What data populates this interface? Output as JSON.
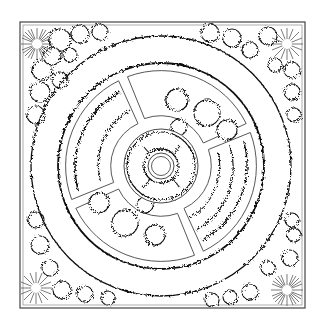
{
  "diagram": {
    "kind": "landscape-garden-plan",
    "style": "black line art on white",
    "colors": {
      "background": "#ffffff",
      "line": "#111111",
      "frame": "#444444"
    },
    "frame": {
      "x": 20,
      "y": 22,
      "width": 285,
      "height": 286
    },
    "center": {
      "x": 161,
      "y": 166
    },
    "elements": {
      "outer_shrub_ring": "irregular hedge/shrub band along frame",
      "path_ring": "wide circular walkway",
      "planting_beds": [
        "top-left",
        "top-right",
        "bottom-left",
        "bottom-right"
      ],
      "central_feature": "circular bed with fountain at center",
      "corner_trees": [
        "top-left",
        "bottom-right"
      ]
    }
  }
}
